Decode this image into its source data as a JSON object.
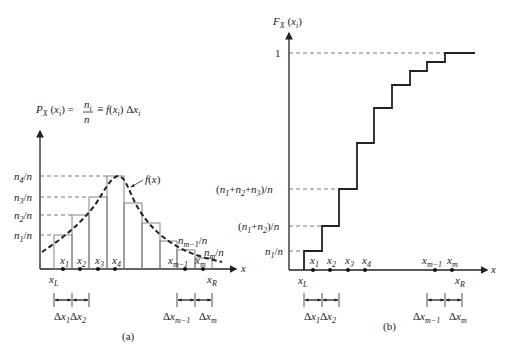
{
  "panel_a": {
    "caption": "(a)",
    "y_title": "P_X (x_i) = n_i/n = f(x_i) Δx_i",
    "y_title_parts": {
      "p": "P",
      "x": "X",
      "arg": "(x",
      "i": "i",
      "close": ")",
      "eq": "=",
      "num": "n",
      "den": "n",
      "eq2": "≡ f(x",
      "end": ") Δx"
    },
    "curve_label": "f(x)",
    "x_axis_label": "x",
    "y_ticks": [
      "n4/n",
      "n3/n",
      "n2/n",
      "n1/n"
    ],
    "right_labels": [
      "n(m−1)/n",
      "nm/n"
    ],
    "points": [
      "x1",
      "x2",
      "x3",
      "x4",
      "x(m−1)",
      "xm"
    ],
    "bounds": [
      "xL",
      "xR"
    ],
    "intervals": [
      "Δx1",
      "Δx2",
      "Δx(m−1)",
      "Δxm"
    ]
  },
  "panel_b": {
    "caption": "(b)",
    "y_title": "F_X (x_i)",
    "x_axis_label": "x",
    "y_ticks": [
      "1",
      "(n1+n2+n3)/n",
      "(n1+n2)/n",
      "n1/n"
    ],
    "points": [
      "x1",
      "x2",
      "x3",
      "x4",
      "x(m−1)",
      "xm"
    ],
    "bounds": [
      "xL",
      "xR"
    ],
    "intervals": [
      "Δx1",
      "Δx2",
      "Δx(m−1)",
      "Δxm"
    ]
  },
  "text": {
    "one": "1",
    "n": "n",
    "x": "x",
    "f": "f(x)",
    "cap_a": "(a)",
    "cap_b": "(b)",
    "slash_n": "/n",
    "delta": "Δx",
    "F": "F",
    "P": "P",
    "X": "X"
  }
}
